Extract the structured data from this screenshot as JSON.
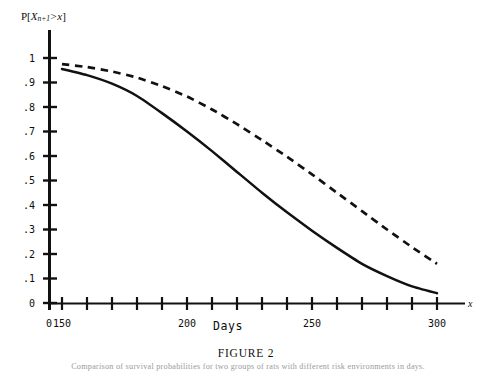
{
  "figure": {
    "title": "FIGURE 2",
    "caption": "Comparison of survival probabilities for two groups of rats with different risk environments in days.",
    "y_axis_expression": {
      "prefix": "P[",
      "variable": "X",
      "subscript": "n+1",
      "relation": ">",
      "argument": "x",
      "suffix": "]",
      "plain": "P[X n+1 > x]"
    },
    "x_axis_name": "Days",
    "x_axis_symbol": "x",
    "origin_label": "0"
  },
  "chart_data": {
    "type": "line",
    "title": "FIGURE 2",
    "xlabel": "Days",
    "ylabel": "P[X n+1 > x]",
    "xlim": [
      0,
      316.7
    ],
    "ylim": [
      0,
      1.04
    ],
    "grid": false,
    "legend": "none",
    "x_tick_labels": [
      "0",
      "150",
      "200",
      "250",
      "300"
    ],
    "x_labeled_ticks": [
      0,
      150,
      200,
      250,
      300
    ],
    "x_minor_ticks": [
      150,
      160,
      170,
      180,
      190,
      200,
      210,
      220,
      230,
      240,
      250,
      260,
      270,
      280,
      290,
      300
    ],
    "y_tick_labels": [
      "0",
      ".1",
      ".2",
      ".3",
      ".4",
      ".5",
      ".6",
      ".7",
      ".8",
      ".9",
      "1"
    ],
    "y_ticks": [
      0,
      0.1,
      0.2,
      0.3,
      0.4,
      0.5,
      0.6,
      0.7,
      0.8,
      0.9,
      1
    ],
    "x": [
      150,
      160,
      170,
      180,
      190,
      200,
      210,
      220,
      230,
      240,
      250,
      260,
      270,
      280,
      290,
      300
    ],
    "series": [
      {
        "name": "solid-curve",
        "style": "solid",
        "color": "#111111",
        "values": [
          0.955,
          0.93,
          0.895,
          0.845,
          0.775,
          0.7,
          0.62,
          0.535,
          0.45,
          0.37,
          0.295,
          0.225,
          0.16,
          0.11,
          0.068,
          0.04
        ]
      },
      {
        "name": "dashed-curve",
        "style": "dashed",
        "color": "#111111",
        "values": [
          0.975,
          0.963,
          0.945,
          0.92,
          0.885,
          0.843,
          0.79,
          0.73,
          0.665,
          0.597,
          0.525,
          0.45,
          0.375,
          0.3,
          0.228,
          0.16
        ]
      }
    ]
  },
  "geometry": {
    "plot_left_px": 49,
    "plot_baseline_px": 303,
    "plot_top_px": 30,
    "plot_right_px": 465,
    "y_top_value_px": 58,
    "y_step_px": 24.5,
    "x_tick_start_px": 62,
    "x_tick_step_px": 25
  }
}
